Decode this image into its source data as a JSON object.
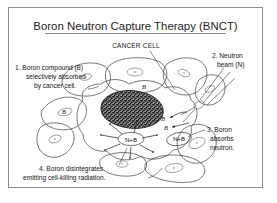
{
  "figure": {
    "title": "Boron Neutron Capture Therapy (BNCT)",
    "title_underlined": true,
    "background_color": "#ffffff",
    "frame_color": "#8d8d8d",
    "ink_color": "#1d1d1d"
  },
  "labels": {
    "cancer_cell": "CANCER CELL",
    "step1": {
      "line1": "1. Boron compound (B)",
      "line2": "selectively absorbed",
      "line3": "by cancer cell."
    },
    "step2": {
      "line1": "2. Neutron",
      "line2": "beam (N)"
    },
    "step3": {
      "line1": "3. Boron",
      "line2": "absorbs",
      "line3": "neutron."
    },
    "step4": {
      "line1": "4. Boron disintegrates",
      "line2": "emitting cell-killing radiation."
    }
  },
  "molecule_labels": {
    "boron_in_cell": "B",
    "boron_left_cell": "B",
    "boron_right_1": "B",
    "boron_right_2": "B",
    "capture_left": "N+B",
    "capture_right": "N+B"
  },
  "colors": {
    "tumor_cytoplasm": "#d5d5d5",
    "nucleus_stipple": "#2b2b2b",
    "normal_cell_fill": "#ffffff",
    "outline": "#4a4a4a"
  }
}
